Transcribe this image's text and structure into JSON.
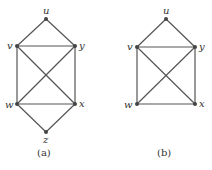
{
  "graphs": [
    {
      "caption": "(a)",
      "nodes": [
        {
          "id": "u",
          "label": "u",
          "x": 46,
          "y": 19
        },
        {
          "id": "v",
          "label": "v",
          "x": 17,
          "y": 46
        },
        {
          "id": "y",
          "label": "y",
          "x": 75,
          "y": 46
        },
        {
          "id": "w",
          "label": "w",
          "x": 17,
          "y": 104
        },
        {
          "id": "x",
          "label": "x",
          "x": 75,
          "y": 104
        },
        {
          "id": "z",
          "label": "z",
          "x": 46,
          "y": 132
        }
      ],
      "edges": [
        [
          "u",
          "v"
        ],
        [
          "u",
          "y"
        ],
        [
          "v",
          "y"
        ],
        [
          "v",
          "w"
        ],
        [
          "y",
          "x"
        ],
        [
          "v",
          "x"
        ],
        [
          "y",
          "w"
        ],
        [
          "w",
          "x"
        ],
        [
          "w",
          "z"
        ],
        [
          "x",
          "z"
        ]
      ]
    },
    {
      "caption": "(b)",
      "nodes": [
        {
          "id": "u",
          "label": "u",
          "x": 166,
          "y": 19
        },
        {
          "id": "v",
          "label": "v",
          "x": 137,
          "y": 47
        },
        {
          "id": "y",
          "label": "y",
          "x": 195,
          "y": 47
        },
        {
          "id": "w",
          "label": "w",
          "x": 137,
          "y": 104
        },
        {
          "id": "x",
          "label": "x",
          "x": 195,
          "y": 104
        }
      ],
      "edges": [
        [
          "u",
          "v"
        ],
        [
          "u",
          "y"
        ],
        [
          "v",
          "y"
        ],
        [
          "v",
          "w"
        ],
        [
          "y",
          "x"
        ],
        [
          "v",
          "x"
        ],
        [
          "y",
          "w"
        ],
        [
          "w",
          "x"
        ]
      ]
    }
  ]
}
